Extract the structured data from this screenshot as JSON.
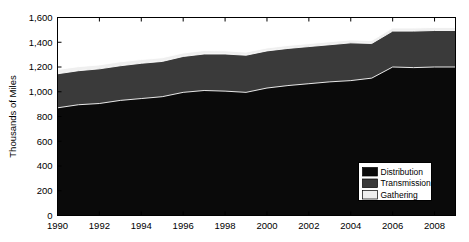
{
  "chart_data": {
    "type": "area",
    "stacked": true,
    "title": "",
    "subtitle": "",
    "xlabel": "",
    "ylabel": "Thousands of Miles",
    "xlim": [
      1990,
      2009
    ],
    "ylim": [
      0,
      1600
    ],
    "grid": false,
    "legend_position": "bottom-right",
    "x": [
      1990,
      1991,
      1992,
      1993,
      1994,
      1995,
      1996,
      1997,
      1998,
      1999,
      2000,
      2001,
      2002,
      2003,
      2004,
      2005,
      2006,
      2007,
      2008,
      2009
    ],
    "x_tick_labels": [
      "1990",
      "1992",
      "1994",
      "1996",
      "1998",
      "2000",
      "2002",
      "2004",
      "2006",
      "2008"
    ],
    "x_ticks": [
      1990,
      1992,
      1994,
      1996,
      1998,
      2000,
      2002,
      2004,
      2006,
      2008
    ],
    "y_ticks": [
      0,
      200,
      400,
      600,
      800,
      1000,
      1200,
      1400,
      1600
    ],
    "y_tick_labels": [
      "0",
      "200",
      "400",
      "600",
      "800",
      "1,000",
      "1,200",
      "1,400",
      "1,600"
    ],
    "series": [
      {
        "name": "Distribution",
        "color": "#0a0a0a",
        "values": [
          870,
          895,
          905,
          930,
          945,
          960,
          995,
          1010,
          1005,
          995,
          1030,
          1050,
          1065,
          1080,
          1090,
          1110,
          1200,
          1195,
          1200,
          1200
        ]
      },
      {
        "name": "Transmission",
        "color": "#3a3a3a",
        "values": [
          275,
          275,
          280,
          280,
          285,
          285,
          290,
          295,
          300,
          300,
          300,
          300,
          300,
          300,
          305,
          280,
          290,
          295,
          295,
          295
        ]
      },
      {
        "name": "Gathering",
        "color": "#efefef",
        "values": [
          35,
          33,
          32,
          32,
          30,
          30,
          28,
          28,
          26,
          25,
          24,
          24,
          24,
          24,
          24,
          24,
          25,
          25,
          25,
          25
        ]
      }
    ],
    "cumulative_tops": {
      "distribution": [
        870,
        895,
        905,
        930,
        945,
        960,
        995,
        1010,
        1005,
        995,
        1030,
        1050,
        1065,
        1080,
        1090,
        1110,
        1200,
        1195,
        1200,
        1200
      ],
      "transmission": [
        1145,
        1170,
        1185,
        1210,
        1230,
        1245,
        1285,
        1305,
        1305,
        1295,
        1330,
        1350,
        1365,
        1380,
        1395,
        1390,
        1490,
        1490,
        1495,
        1495
      ],
      "gathering": [
        1180,
        1203,
        1217,
        1242,
        1260,
        1275,
        1313,
        1333,
        1331,
        1320,
        1354,
        1374,
        1389,
        1404,
        1419,
        1414,
        1515,
        1515,
        1520,
        1520
      ]
    }
  },
  "legend": {
    "items": [
      {
        "label": "Distribution",
        "swatch_color": "#0a0a0a"
      },
      {
        "label": "Transmission",
        "swatch_color": "#3a3a3a"
      },
      {
        "label": "Gathering",
        "swatch_color": "#efefef"
      }
    ]
  },
  "axes": {
    "y_title": "Thousands of Miles"
  }
}
